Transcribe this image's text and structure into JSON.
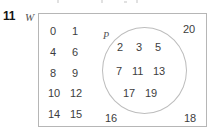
{
  "question_number": "11",
  "figure": {
    "universal_set_label": "W",
    "subset_label": "P",
    "outside_numbers": [
      "0",
      "1",
      "4",
      "6",
      "8",
      "9",
      "10",
      "12",
      "14",
      "15",
      "16",
      "18",
      "20"
    ],
    "inside_numbers": [
      "2",
      "3",
      "5",
      "7",
      "11",
      "13",
      "17",
      "19"
    ],
    "grid": {
      "row1": {
        "left": "0",
        "right": "1"
      },
      "row2": {
        "left": "4",
        "right": "6"
      },
      "row3": {
        "left": "8",
        "right": "9"
      },
      "row4": {
        "left": "10",
        "right": "12"
      },
      "row5": {
        "left": "14",
        "right": "15"
      }
    },
    "corners": {
      "top_right": "20",
      "bottom_left": "16",
      "bottom_right": "18"
    },
    "circle_rows": {
      "row1": [
        "2",
        "3",
        "5"
      ],
      "row2": [
        "7",
        "11",
        "13"
      ],
      "row3": [
        "17",
        "19"
      ]
    }
  },
  "colors": {
    "outline": "#b6b6b6",
    "circle_outline": "#bdbdbd",
    "text": "#3d3d3d",
    "label": "#555555",
    "question_number": "#141414",
    "background": "#ffffff"
  }
}
